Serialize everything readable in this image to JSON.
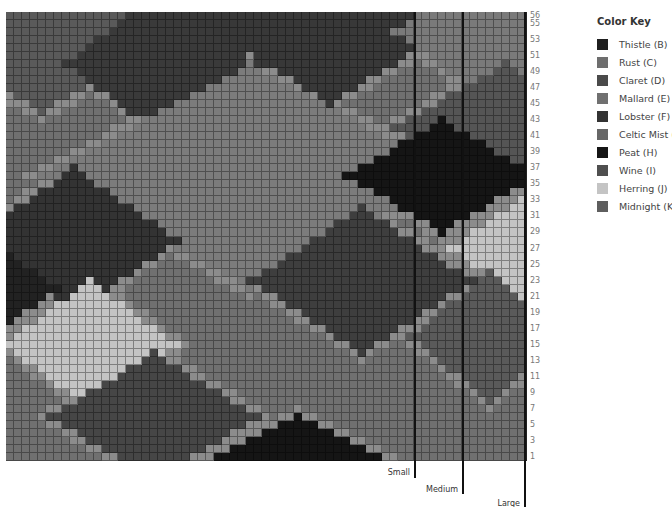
{
  "legend": {
    "title": "Color Key",
    "items": [
      {
        "label": "Thistle (B)",
        "color": "#1f1f1f"
      },
      {
        "label": "Rust (C)",
        "color": "#6e6e6e"
      },
      {
        "label": "Claret (D)",
        "color": "#4a4a4a"
      },
      {
        "label": "Mallard (E)",
        "color": "#707070"
      },
      {
        "label": "Lobster (F)",
        "color": "#333333"
      },
      {
        "label": "Celtic Mist (G)",
        "color": "#676767"
      },
      {
        "label": "Peat (H)",
        "color": "#151515"
      },
      {
        "label": "Wine (I)",
        "color": "#4f4f4f"
      },
      {
        "label": "Herring (J)",
        "color": "#c4c4c4"
      },
      {
        "label": "Midnight (K)",
        "color": "#5e5e5e"
      }
    ]
  },
  "grid": {
    "cols": 65,
    "rows": 56,
    "row_labels": [
      "56",
      "55",
      "53",
      "51",
      "49",
      "47",
      "45",
      "43",
      "41",
      "39",
      "37",
      "35",
      "33",
      "31",
      "29",
      "27",
      "25",
      "23",
      "21",
      "19",
      "17",
      "15",
      "13",
      "11",
      "9",
      "7",
      "5",
      "3",
      "1"
    ],
    "background": "#707070",
    "highlight": "#8c8c8c",
    "diamonds": [
      {
        "cx": 4,
        "cy": 0,
        "rx": 22,
        "ry": 12,
        "color": "#5a5a5a"
      },
      {
        "cx": 19,
        "cy": 6,
        "rx": 12,
        "ry": 9,
        "color": "#3a3a3a"
      },
      {
        "cx": 40,
        "cy": 0,
        "rx": 18,
        "ry": 11,
        "color": "#383838"
      },
      {
        "cx": 62,
        "cy": 2,
        "rx": 14,
        "ry": 10,
        "color": "#7a7a7a"
      },
      {
        "cx": 62,
        "cy": 14,
        "rx": 14,
        "ry": 8,
        "color": "#555555"
      },
      {
        "cx": 30,
        "cy": 20,
        "rx": 26,
        "ry": 14,
        "color": "#7c7c7c"
      },
      {
        "cx": 54,
        "cy": 20,
        "rx": 12,
        "ry": 7,
        "color": "#151515"
      },
      {
        "cx": 8,
        "cy": 28,
        "rx": 13,
        "ry": 9,
        "color": "#333333"
      },
      {
        "cx": 0,
        "cy": 34,
        "rx": 6,
        "ry": 4,
        "color": "#222222"
      },
      {
        "cx": 44,
        "cy": 33,
        "rx": 14,
        "ry": 9,
        "color": "#3e3e3e"
      },
      {
        "cx": 64,
        "cy": 29,
        "rx": 9,
        "ry": 6,
        "color": "#c4c4c4"
      },
      {
        "cx": 10,
        "cy": 41,
        "rx": 11,
        "ry": 8,
        "color": "#c4c4c4"
      },
      {
        "cx": 60,
        "cy": 40,
        "rx": 10,
        "ry": 8,
        "color": "#5a5a5a"
      },
      {
        "cx": 18,
        "cy": 50,
        "rx": 13,
        "ry": 8,
        "color": "#464646"
      },
      {
        "cx": 36,
        "cy": 56,
        "rx": 12,
        "ry": 6,
        "color": "#151515"
      }
    ]
  },
  "sizes": [
    {
      "label": "Small"
    },
    {
      "label": "Medium"
    },
    {
      "label": "Large"
    }
  ]
}
